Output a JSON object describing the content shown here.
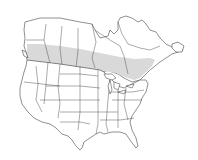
{
  "map": {
    "region": "North America (United States and Canada)",
    "description": "Species range map with breeding range shaded across southern Canada and the northern Great Lakes / New England region",
    "colors": {
      "background": "#ffffff",
      "land": "#ffffff",
      "outline": "#333333",
      "range_fill": "#d9d9d9"
    },
    "layers": [
      {
        "name": "range",
        "label": "Range",
        "shaded": true
      }
    ]
  }
}
